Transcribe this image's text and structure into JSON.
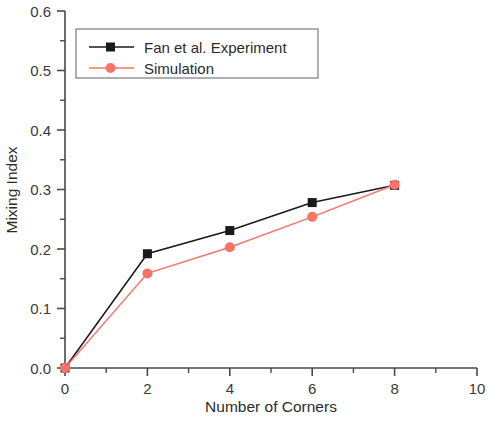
{
  "chart_data": {
    "type": "line",
    "title": "",
    "xlabel": "Number of Corners",
    "ylabel": "Mixing Index",
    "xlim": [
      0,
      10
    ],
    "ylim": [
      0.0,
      0.6
    ],
    "grid": false,
    "legend_position": "top-left",
    "x_ticks": [
      "0",
      "2",
      "4",
      "6",
      "8",
      "10"
    ],
    "x_tick_values": [
      0,
      2,
      4,
      6,
      8,
      10
    ],
    "x_minor_tick_values": [
      1,
      3,
      5,
      7,
      9
    ],
    "y_ticks": [
      "0.0",
      "0.1",
      "0.2",
      "0.3",
      "0.4",
      "0.5",
      "0.6"
    ],
    "y_tick_values": [
      0.0,
      0.1,
      0.2,
      0.3,
      0.4,
      0.5,
      0.6
    ],
    "y_minor_tick_values": [
      0.05,
      0.15,
      0.25,
      0.35,
      0.45,
      0.55
    ],
    "x": [
      0,
      2,
      4,
      6,
      8
    ],
    "series": [
      {
        "name": "Fan et al. Experiment",
        "color": "#1a1a1a",
        "marker": "square",
        "values": [
          0.0,
          0.192,
          0.231,
          0.278,
          0.307
        ]
      },
      {
        "name": "Simulation",
        "color": "#fa7268",
        "marker": "circle",
        "values": [
          0.0,
          0.159,
          0.203,
          0.254,
          0.308
        ]
      }
    ]
  },
  "legend": {
    "entries": [
      {
        "label": "Fan et al. Experiment"
      },
      {
        "label": "Simulation"
      }
    ]
  },
  "axes": {
    "x_label": "Number of Corners",
    "y_label": "Mixing Index"
  },
  "colors": {
    "experiment": "#1a1a1a",
    "simulation": "#fa7268",
    "axis": "#4a4a4a",
    "background": "#ffffff"
  }
}
